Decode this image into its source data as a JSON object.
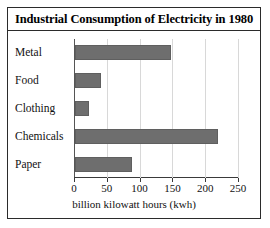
{
  "chart_data": {
    "type": "bar",
    "orientation": "horizontal",
    "title": "Industrial Consumption of Electricity in 1980",
    "categories": [
      "Metal",
      "Food",
      "Clothing",
      "Chemicals",
      "Paper"
    ],
    "values": [
      147,
      40,
      21,
      218,
      87
    ],
    "xlabel": "billion kilowatt hours (kwh)",
    "ylabel": "",
    "xlim": [
      0,
      250
    ],
    "xticks": [
      0,
      50,
      100,
      150,
      200,
      250
    ],
    "xtick_labels": [
      "0",
      "50",
      "100",
      "150",
      "200",
      "250"
    ],
    "grid": "vertical",
    "legend": "none",
    "bar_color": "#6e6e6e",
    "frame_color": "#2b2b2b"
  }
}
